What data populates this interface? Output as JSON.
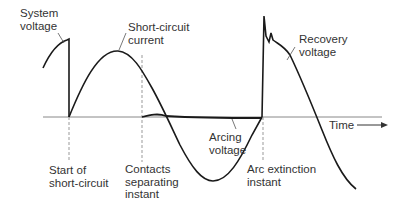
{
  "colors": {
    "curve": "#1a1a1a",
    "axis": "#888888",
    "dashed": "#999999",
    "text": "#333333"
  },
  "axis": {
    "label": "Time"
  },
  "curves": {
    "system_voltage": "System\nvoltage",
    "short_circuit_current": "Short-circuit\ncurrent",
    "recovery_voltage": "Recovery\nvoltage",
    "arcing_voltage": "Arcing\nvoltage"
  },
  "events": {
    "start_of_short_circuit": "Start of\nshort-circuit",
    "contacts_separating": "Contacts\nseparating\ninstant",
    "arc_extinction": "Arc extinction\ninstant"
  }
}
